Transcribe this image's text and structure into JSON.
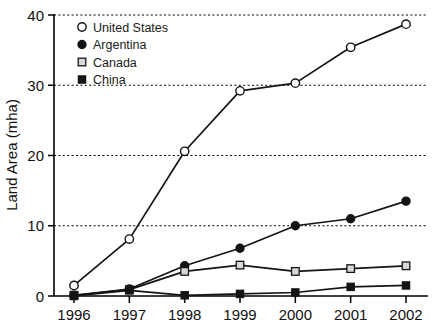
{
  "chart_data": {
    "type": "line",
    "title": "",
    "xlabel": "",
    "ylabel": "Land Area (mha)",
    "categories": [
      "1996",
      "1997",
      "1998",
      "1999",
      "2000",
      "2001",
      "2002"
    ],
    "x": [
      1996,
      1997,
      1998,
      1999,
      2000,
      2001,
      2002
    ],
    "xlim": [
      1996,
      2002
    ],
    "ylim": [
      0,
      40
    ],
    "yticks": [
      0,
      10,
      20,
      30,
      40
    ],
    "ytick_labels": [
      "0",
      "10",
      "20",
      "30",
      "40"
    ],
    "xtick_labels": [
      "1996",
      "1997",
      "1998",
      "1999",
      "2000",
      "2001",
      "2002"
    ],
    "grid": "horizontal-dashed",
    "legend_position": "upper-left-inside",
    "series": [
      {
        "name": "United States",
        "marker": "open-circle",
        "color": "#141414",
        "values": [
          1.5,
          8.1,
          20.6,
          29.2,
          30.3,
          35.4,
          38.7
        ]
      },
      {
        "name": "Argentina",
        "marker": "filled-circle",
        "color": "#141414",
        "values": [
          0.1,
          1.0,
          4.3,
          6.8,
          10.0,
          11.0,
          13.5
        ]
      },
      {
        "name": "Canada",
        "marker": "open-square",
        "color": "#141414",
        "values": [
          0.1,
          0.9,
          3.5,
          4.4,
          3.5,
          3.9,
          4.3
        ]
      },
      {
        "name": "China",
        "marker": "filled-square",
        "color": "#141414",
        "values": [
          0.0,
          0.8,
          0.1,
          0.3,
          0.5,
          1.3,
          1.5
        ]
      }
    ]
  },
  "legend": {
    "entries": [
      {
        "label": "United States",
        "marker": "open-circle"
      },
      {
        "label": "Argentina",
        "marker": "filled-circle"
      },
      {
        "label": "Canada",
        "marker": "open-square"
      },
      {
        "label": "China",
        "marker": "filled-square"
      }
    ]
  },
  "colors": {
    "line": "#141414",
    "grid": "#000000",
    "axis": "#000000",
    "text": "#111111",
    "background": "#ffffff",
    "open_marker_fill": "#ffffff",
    "open_square_fill": "#d7d7d7"
  }
}
